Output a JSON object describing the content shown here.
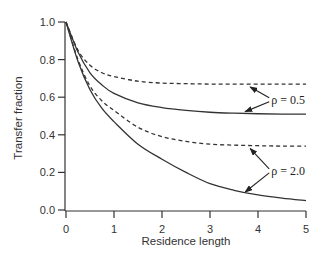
{
  "chart_data": {
    "type": "line",
    "title": "",
    "xlabel": "Residence length",
    "ylabel": "Transfer fraction",
    "xlim": [
      0,
      5
    ],
    "ylim": [
      0,
      1.0
    ],
    "xticks": [
      0,
      1,
      2,
      3,
      4,
      5
    ],
    "xtick_labels": [
      "0",
      "1",
      "2",
      "3",
      "4",
      "5"
    ],
    "yticks": [
      0.0,
      0.2,
      0.4,
      0.6,
      0.8,
      1.0
    ],
    "ytick_labels": [
      "0.0",
      "0.2",
      "0.4",
      "0.6",
      "0.8",
      "1.0"
    ],
    "grid": false,
    "legend": null,
    "x": [
      0,
      0.25,
      0.5,
      0.75,
      1,
      1.5,
      2,
      2.5,
      3,
      3.5,
      4,
      4.5,
      5
    ],
    "series": [
      {
        "name": "rho=0.5 dashed",
        "style": "dashed",
        "values": [
          1.0,
          0.85,
          0.77,
          0.73,
          0.71,
          0.685,
          0.675,
          0.672,
          0.67,
          0.67,
          0.67,
          0.67,
          0.67
        ]
      },
      {
        "name": "rho=0.5 solid",
        "style": "solid",
        "values": [
          1.0,
          0.84,
          0.73,
          0.665,
          0.62,
          0.57,
          0.545,
          0.53,
          0.52,
          0.515,
          0.512,
          0.51,
          0.51
        ]
      },
      {
        "name": "rho=2.0 dashed",
        "style": "dashed",
        "values": [
          1.0,
          0.8,
          0.66,
          0.58,
          0.53,
          0.44,
          0.39,
          0.365,
          0.35,
          0.345,
          0.342,
          0.34,
          0.34
        ]
      },
      {
        "name": "rho=2.0 solid",
        "style": "solid",
        "values": [
          1.0,
          0.79,
          0.64,
          0.54,
          0.47,
          0.35,
          0.27,
          0.2,
          0.14,
          0.105,
          0.08,
          0.063,
          0.05
        ]
      }
    ],
    "annotations": [
      {
        "text": "ρ = 0.5",
        "points_to": [
          "rho=0.5 dashed",
          "rho=0.5 solid"
        ],
        "at_x": 3.9
      },
      {
        "text": "ρ = 2.0",
        "points_to": [
          "rho=2.0 dashed",
          "rho=2.0 solid"
        ],
        "at_x": 3.9
      }
    ]
  }
}
